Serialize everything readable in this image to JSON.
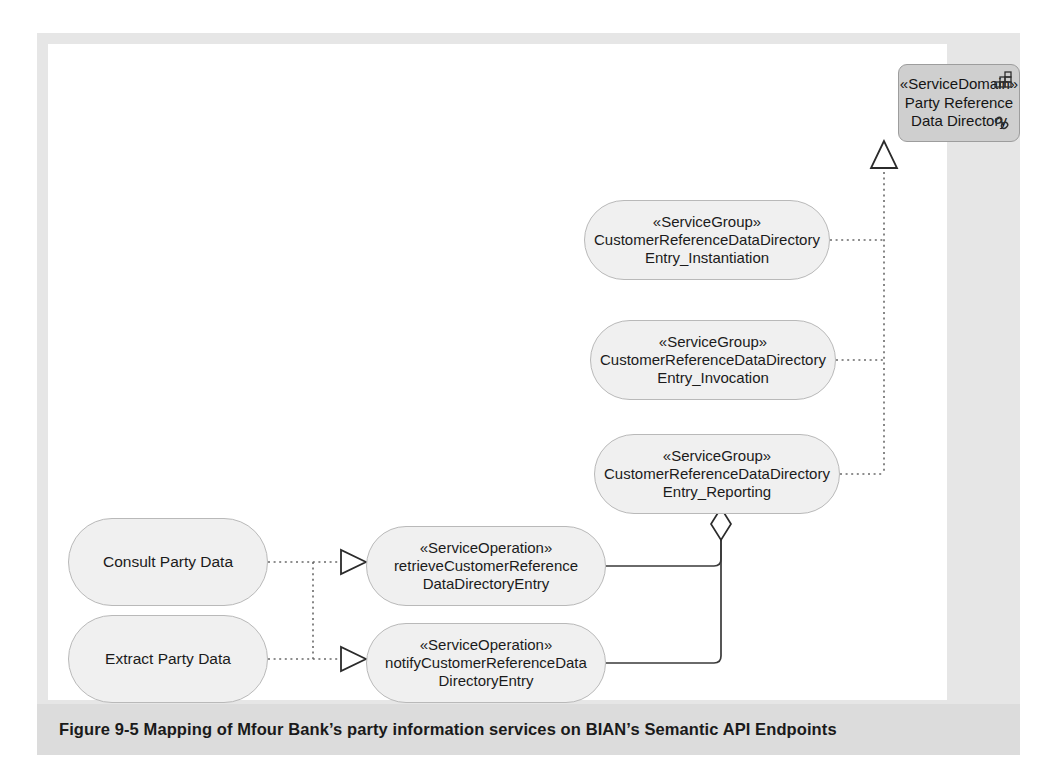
{
  "figure": {
    "caption": "Figure 9-5  Mapping of Mfour Bank’s party information services on BIAN’s Semantic API Endpoints",
    "frame_color": "#e6e6e6",
    "caption_band_color": "#dcdcdc"
  },
  "service_domain": {
    "stereotype": "«ServiceDomain»",
    "name_line1": "Party Reference",
    "name_line2": "Data Directory",
    "fill": "#cfcfcf",
    "icons": [
      "component-grid-icon",
      "chain-link-icon"
    ]
  },
  "service_groups": [
    {
      "stereotype": "«ServiceGroup»",
      "name_line1": "CustomerReferenceDataDirectory",
      "name_line2": "Entry_Instantiation"
    },
    {
      "stereotype": "«ServiceGroup»",
      "name_line1": "CustomerReferenceDataDirectory",
      "name_line2": "Entry_Invocation"
    },
    {
      "stereotype": "«ServiceGroup»",
      "name_line1": "CustomerReferenceDataDirectory",
      "name_line2": "Entry_Reporting"
    }
  ],
  "service_operations": [
    {
      "stereotype": "«ServiceOperation»",
      "name_line1": "retrieveCustomerReference",
      "name_line2": "DataDirectoryEntry"
    },
    {
      "stereotype": "«ServiceOperation»",
      "name_line1": "notifyCustomerReferenceData",
      "name_line2": "DirectoryEntry"
    }
  ],
  "business_services": [
    {
      "label": "Consult Party Data"
    },
    {
      "label": "Extract Party Data"
    }
  ],
  "connectors": {
    "generalization": "hollow-triangle-dotted",
    "aggregation": "hollow-diamond-solid",
    "realization": "hollow-triangle-dotted"
  }
}
